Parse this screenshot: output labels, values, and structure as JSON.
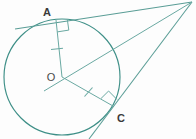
{
  "figure": {
    "canvas": {
      "width": 196,
      "height": 139,
      "background": "#fdfdfd"
    },
    "stroke_color": "#3e8f87",
    "stroke_color_light": "#6aa9a2",
    "label_color": "#3a3a3a",
    "stroke_width": 1.1
  },
  "labels": {
    "point_a": "A",
    "point_o": "O",
    "point_c": "C"
  },
  "points": {
    "center_o": {
      "x": 62,
      "y": 77,
      "name": "O"
    },
    "tangent_a": {
      "x": 56,
      "y": 19,
      "name": "A"
    },
    "tangent_c": {
      "x": 113,
      "y": 107,
      "name": "C"
    },
    "external_p": {
      "x": 191,
      "y": 2,
      "name": "P"
    },
    "label_a": {
      "x": 47,
      "y": 13
    },
    "label_o": {
      "x": 47,
      "y": 80
    },
    "label_c": {
      "x": 117,
      "y": 120
    }
  },
  "circle": {
    "cx": 62,
    "cy": 77,
    "r": 58
  },
  "segments": [
    {
      "name": "radius-oa",
      "from": "O",
      "to": "A",
      "tick": true
    },
    {
      "name": "radius-oc",
      "from": "O",
      "to": "C",
      "tick": true
    },
    {
      "name": "tangent-pa",
      "from": "P",
      "to": "A",
      "tick": false
    },
    {
      "name": "tangent-pc",
      "from": "P",
      "to": "C",
      "tick": false
    },
    {
      "name": "line-po",
      "from": "P",
      "to": "O",
      "tick": false
    }
  ],
  "right_angles": [
    {
      "name": "right-angle-at-a",
      "at": "A"
    },
    {
      "name": "right-angle-at-c",
      "at": "C"
    }
  ],
  "tick_marks": [
    {
      "name": "tick-oa",
      "x": 57,
      "y": 49
    },
    {
      "name": "tick-oc",
      "x": 88,
      "y": 92
    }
  ]
}
